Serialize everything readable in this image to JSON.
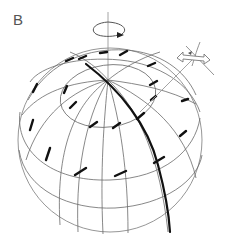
{
  "figure": {
    "panel_label": "B",
    "sphere": {
      "cx": 110,
      "cy": 140,
      "r": 92
    },
    "pole": {
      "x": 108,
      "y": 80
    },
    "colors": {
      "grid": "#6a6a6a",
      "outline": "#8a8a8a",
      "emphasis": "#111111",
      "axis": "#9a9a9a"
    }
  }
}
